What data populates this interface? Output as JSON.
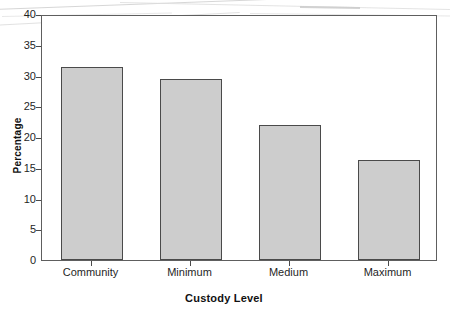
{
  "chart_data": {
    "type": "bar",
    "title": "",
    "xlabel": "Custody Level",
    "ylabel": "Percentage",
    "categories": [
      "Community",
      "Minimum",
      "Medium",
      "Maximum"
    ],
    "values": [
      31.4,
      29.5,
      22.0,
      16.3
    ],
    "ylim": [
      0,
      40
    ],
    "ytick_step": 5,
    "ytick_labels": [
      "0",
      "5",
      "10",
      "15",
      "20",
      "25",
      "30",
      "35",
      "40"
    ],
    "grid": false,
    "legend": false,
    "bar_fill_color": "#cdcdcd",
    "bar_border_color": "#4a4a4a",
    "axis_color": "#5e5e5e",
    "text_color": "#1f1f1f"
  }
}
